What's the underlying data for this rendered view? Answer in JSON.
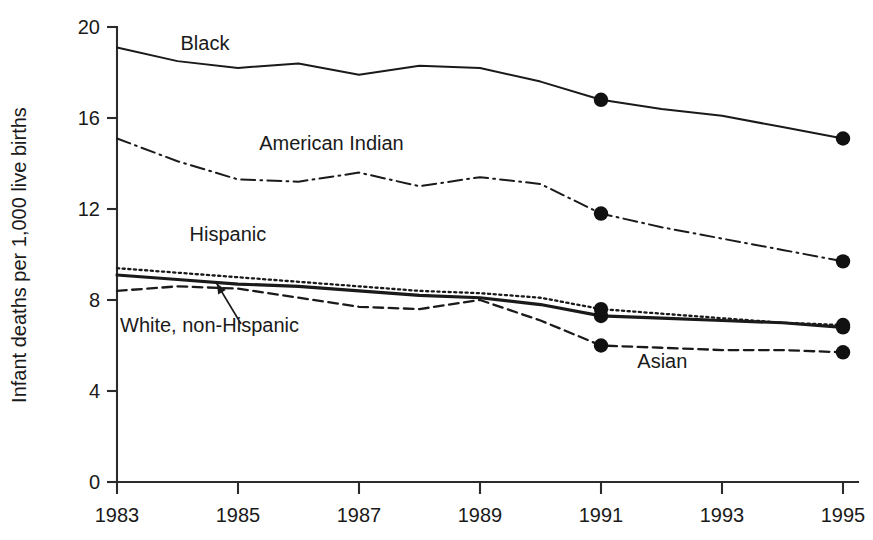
{
  "chart_data": {
    "type": "line",
    "title": "",
    "xlabel": "",
    "ylabel": "Infant deaths per 1,000 live births",
    "xlim": [
      1983,
      1995
    ],
    "ylim": [
      0,
      20
    ],
    "grid": false,
    "legend_position": "inline-labels",
    "x": [
      1983,
      1984,
      1985,
      1986,
      1987,
      1988,
      1989,
      1990,
      1991,
      1992,
      1993,
      1994,
      1995
    ],
    "xticks": [
      "1983",
      "1985",
      "1987",
      "1989",
      "1991",
      "1993",
      "1995"
    ],
    "xtick_values": [
      1983,
      1985,
      1987,
      1989,
      1991,
      1993,
      1995
    ],
    "yticks": [
      "0",
      "4",
      "8",
      "12",
      "16",
      "20"
    ],
    "ytick_values": [
      0,
      4,
      8,
      12,
      16,
      20
    ],
    "series": [
      {
        "name": "Black",
        "label": "Black",
        "style": "solid",
        "width": 2.0,
        "label_x": 1984.05,
        "label_y": 19.0,
        "marker_years": [
          1991,
          1995
        ],
        "values": [
          19.1,
          18.5,
          18.2,
          18.4,
          17.9,
          18.3,
          18.2,
          17.6,
          16.8,
          16.4,
          16.1,
          15.6,
          15.1
        ]
      },
      {
        "name": "American Indian",
        "label": "American Indian",
        "style": "dashdot",
        "width": 2.0,
        "label_x": 1985.35,
        "label_y": 14.6,
        "marker_years": [
          1991,
          1995
        ],
        "values": [
          15.1,
          14.1,
          13.3,
          13.2,
          13.6,
          13.0,
          13.4,
          13.1,
          11.8,
          11.2,
          10.7,
          10.2,
          9.7
        ]
      },
      {
        "name": "Hispanic",
        "label": "Hispanic",
        "style": "dotted",
        "width": 2.3,
        "label_x": 1984.2,
        "label_y": 10.6,
        "marker_years": [
          1991,
          1995
        ],
        "values": [
          9.4,
          9.2,
          9.0,
          8.8,
          8.6,
          8.4,
          8.3,
          8.1,
          7.6,
          7.4,
          7.2,
          7.0,
          6.9
        ]
      },
      {
        "name": "White, non-Hispanic",
        "label": "White, non-Hispanic",
        "style": "solid-thick",
        "width": 3.2,
        "label_x": 1983.05,
        "label_y": 6.6,
        "marker_years": [
          1991,
          1995
        ],
        "values": [
          9.1,
          8.9,
          8.7,
          8.6,
          8.4,
          8.2,
          8.1,
          7.8,
          7.3,
          7.2,
          7.1,
          7.0,
          6.8
        ]
      },
      {
        "name": "Asian",
        "label": "Asian",
        "style": "dashed",
        "width": 2.3,
        "label_x": 1991.6,
        "label_y": 5.0,
        "marker_years": [
          1991,
          1995
        ],
        "values": [
          8.4,
          8.6,
          8.5,
          8.1,
          7.7,
          7.6,
          8.0,
          7.1,
          6.0,
          5.9,
          5.8,
          5.8,
          5.7
        ]
      }
    ],
    "annotation": {
      "name": "white-non-hispanic-pointer",
      "from_x": 1985.05,
      "from_y": 6.95,
      "to_x": 1984.65,
      "to_y": 8.72
    }
  }
}
